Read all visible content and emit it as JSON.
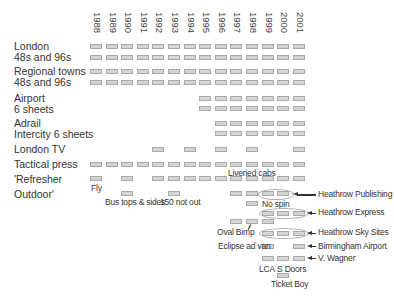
{
  "chart_data": {
    "type": "timeline",
    "title": "",
    "years": [
      "1988",
      "1989",
      "1990",
      "1991",
      "1992",
      "1993",
      "1994",
      "1995",
      "1996",
      "1997",
      "1998",
      "1999",
      "2000",
      "2001"
    ],
    "rows": [
      {
        "label": "London",
        "years": [
          "1988",
          "1989",
          "1990",
          "1991",
          "1992",
          "1993",
          "1994",
          "1995",
          "1996",
          "1997",
          "1998",
          "1999",
          "2000",
          "2001"
        ]
      },
      {
        "label": "48s and 96s",
        "years": [
          "1988",
          "1989",
          "1990",
          "1991",
          "1992",
          "1993",
          "1994",
          "1995",
          "1996",
          "1997",
          "1998",
          "1999",
          "2000",
          "2001"
        ]
      },
      {
        "label": "Regional towns",
        "years": [
          "1988",
          "1989",
          "1990",
          "1991",
          "1992",
          "1993",
          "1994",
          "1995",
          "1996",
          "1997",
          "1998",
          "1999",
          "2000",
          "2001"
        ]
      },
      {
        "label": "48s and 96s",
        "years": [
          "1988",
          "1989",
          "1990",
          "1991",
          "1992",
          "1993",
          "1994",
          "1995",
          "1996",
          "1997",
          "1998",
          "1999",
          "2000",
          "2001"
        ]
      },
      {
        "label": "Airport",
        "years": [
          "1995",
          "1996",
          "1997",
          "1998",
          "1999",
          "2000",
          "2001"
        ]
      },
      {
        "label": "6 sheets",
        "years": [
          "1995",
          "1996",
          "1997",
          "1998",
          "1999",
          "2000",
          "2001"
        ]
      },
      {
        "label": "Adrail",
        "years": [
          "1996",
          "1997",
          "1998",
          "1999",
          "2000",
          "2001"
        ]
      },
      {
        "label": "Intercity 6 sheets",
        "years": [
          "1996",
          "1997",
          "1998",
          "1999",
          "2000",
          "2001"
        ]
      },
      {
        "label": "London TV",
        "years": [
          "1992",
          "1994",
          "1996",
          "1998",
          "2001"
        ]
      },
      {
        "label": "Tactical press",
        "years": [
          "1988",
          "1989",
          "1990",
          "1991",
          "1992",
          "1993",
          "1994",
          "1995",
          "1996",
          "1997",
          "1998",
          "1999",
          "2000",
          "2001"
        ]
      },
      {
        "label": "'Refresher",
        "years": [
          "1988",
          "1990",
          "1992",
          "1993",
          "1994",
          "1995",
          "1996",
          "1997",
          "1998",
          "1999",
          "2000",
          "2001"
        ]
      },
      {
        "label": "Outdoor'",
        "years": [
          "1990",
          "1993",
          "1997",
          "1998",
          "1999",
          "2000"
        ]
      }
    ],
    "annotations": [
      "Fly",
      "Liveried cabs",
      "Bus tops & sides",
      "150 not out",
      "No spin",
      "Heathrow Publishing",
      "Heathrow Express",
      "Oval Bimp",
      "Heathrow Sky Sites",
      "Eclipse ad van",
      "Birmingham Airport",
      "V. Wagner",
      "LCA",
      "S Doors",
      "Ticket Boy"
    ]
  },
  "labels": {
    "london": "London",
    "london_sizes": "48s and 96s",
    "regional": "Regional towns",
    "regional_sizes": "48s and 96s",
    "airport": "Airport",
    "airport_sheets": "6 sheets",
    "adrail": "Adrail",
    "adrail_sheets": "Intercity 6 sheets",
    "london_tv": "London TV",
    "tactical": "Tactical press",
    "refresher": "'Refresher",
    "outdoor": "Outdoor'"
  },
  "annotations": {
    "fly": "Fly",
    "liveried": "Liveried cabs",
    "bus": "Bus tops & sides",
    "notout": "150 not out",
    "nospin": "No spin",
    "hpub": "Heathrow Publishing",
    "hexp": "Heathrow Express",
    "oval": "Oval Bimp",
    "hsky": "Heathrow Sky Sites",
    "eclipse": "Eclipse ad van",
    "bham": "Birmingham Airport",
    "wagner": "V. Wagner",
    "lca": "LCA",
    "sdoors": "S Doors",
    "ticket": "Ticket Boy"
  }
}
